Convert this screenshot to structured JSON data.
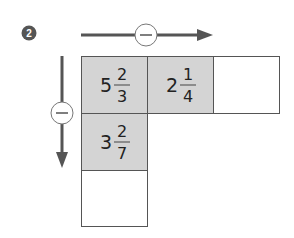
{
  "problem_number": "2",
  "operations": {
    "horizontal": {
      "symbol": "−",
      "direction": "right"
    },
    "vertical": {
      "symbol": "−",
      "direction": "down"
    }
  },
  "grid": {
    "row1": [
      {
        "whole": "5",
        "numerator": "2",
        "denominator": "3",
        "shaded": true
      },
      {
        "whole": "2",
        "numerator": "1",
        "denominator": "4",
        "shaded": true
      },
      {
        "whole": "",
        "numerator": "",
        "denominator": "",
        "shaded": false
      }
    ],
    "row2": [
      {
        "whole": "3",
        "numerator": "2",
        "denominator": "7",
        "shaded": true
      }
    ],
    "row3": [
      {
        "whole": "",
        "numerator": "",
        "denominator": "",
        "shaded": false
      }
    ]
  },
  "colors": {
    "shaded": "#d4d4d4",
    "line": "#555555",
    "badge": "#555555"
  }
}
